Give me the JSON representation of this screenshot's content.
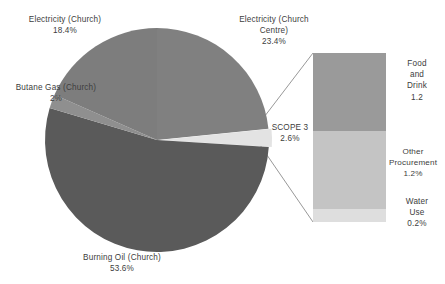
{
  "chart_data": {
    "type": "pie",
    "title": "",
    "subtitle": "",
    "xlabel": "",
    "ylabel": "",
    "legend_position": "none",
    "grid": false,
    "variant": "pie-of-bar",
    "categories": [
      "Burning Oil (Church)",
      "Electricity (Church Centre)",
      "Electricity (Church)",
      "Butane Gas (Church)",
      "SCOPE 3"
    ],
    "values": [
      53.6,
      23.4,
      18.4,
      2.0,
      2.6
    ],
    "value_labels": [
      "53.6%",
      "23.4%",
      "18.4%",
      "2%",
      "2.6%"
    ],
    "slice_colors": [
      "#5a5a5a",
      "#808080",
      "#7d7d7d",
      "#8f8f8f",
      "#e3e3e3"
    ],
    "exploded_slice": "SCOPE 3",
    "breakdown": {
      "of": "SCOPE 3",
      "type": "bar",
      "stacked": true,
      "categories": [
        "Food and Drink",
        "Other Procurement",
        "Water Use"
      ],
      "values": [
        1.2,
        1.2,
        0.2
      ],
      "value_labels": [
        "1.2",
        "1.2%",
        "0.2%"
      ],
      "colors": [
        "#9a9a9a",
        "#c4c4c4",
        "#dedede"
      ]
    }
  },
  "slices": {
    "electricity_church": {
      "name": "Electricity (Church)",
      "value": "18.4%"
    },
    "electricity_church_centre": {
      "name_line1": "Electricity (Church",
      "name_line2": "Centre)",
      "value": "23.4%"
    },
    "butane_gas": {
      "name": "Butane Gas (Church)",
      "value": "2%"
    },
    "burning_oil": {
      "name": "Burning Oil (Church)",
      "value": "53.6%"
    },
    "scope3": {
      "name": "SCOPE 3",
      "value": "2.6%"
    }
  },
  "bar_segments": {
    "food_and_drink": {
      "name_line1": "Food",
      "name_line2": "and",
      "name_line3": "Drink",
      "value": "1.2"
    },
    "other_procurement": {
      "name_line1": "Other",
      "name_line2": "Procurement",
      "value": "1.2%"
    },
    "water_use": {
      "name_line1": "Water",
      "name_line2": "Use",
      "value": "0.2%"
    }
  },
  "colors": {
    "burning_oil": "#5a5a5a",
    "electricity_church_centre": "#808080",
    "electricity_church": "#7d7d7d",
    "butane_gas": "#8f8f8f",
    "scope3": "#e3e3e3",
    "food_and_drink": "#9a9a9a",
    "other_procurement": "#c4c4c4",
    "water_use": "#dedede",
    "leader_line": "#8c8c8c",
    "text": "#3d3d3d"
  }
}
